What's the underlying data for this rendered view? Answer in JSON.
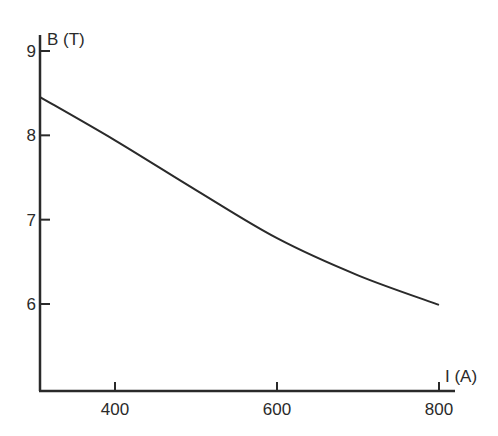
{
  "chart_data": {
    "type": "line",
    "title": "",
    "xlabel": "I (A)",
    "ylabel": "B (T)",
    "xlim": [
      308,
      820
    ],
    "ylim": [
      5.0,
      9.2
    ],
    "x_ticks": [
      400,
      600,
      800
    ],
    "x_tick_labels": [
      "400",
      "600",
      "800"
    ],
    "y_ticks": [
      6,
      7,
      8,
      9
    ],
    "y_tick_labels": [
      "6",
      "7",
      "8",
      "9"
    ],
    "grid": false,
    "legend": null,
    "series": [
      {
        "name": "B vs I",
        "x": [
          308,
          400,
          500,
          600,
          700,
          800
        ],
        "y": [
          8.45,
          7.94,
          7.35,
          6.78,
          6.34,
          5.99
        ]
      }
    ]
  },
  "colors": {
    "line": "#2a2a2a",
    "axis": "#2a2a2a",
    "background": "#ffffff"
  }
}
